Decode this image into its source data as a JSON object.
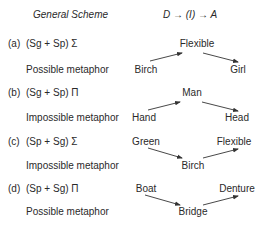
{
  "header": {
    "title": "General Scheme",
    "formula": "D → (I) → A"
  },
  "schemes": [
    {
      "letter": "(a)",
      "formula": "(Sg + Sp) Σ",
      "verdict": "Possible metaphor",
      "shape": "peak",
      "nodes": {
        "left": "Birch",
        "middle": "Flexible",
        "right": "Girl"
      }
    },
    {
      "letter": "(b)",
      "formula": "(Sg + Sp) Π",
      "verdict": "Impossible metaphor",
      "shape": "peak",
      "nodes": {
        "left": "Hand",
        "middle": "Man",
        "right": "Head"
      }
    },
    {
      "letter": "(c)",
      "formula": "(Sp + Sg) Σ",
      "verdict": "Impossible metaphor",
      "shape": "valley",
      "nodes": {
        "left": "Green",
        "middle": "Birch",
        "right": "Flexible"
      }
    },
    {
      "letter": "(d)",
      "formula": "(Sp + Sg) Π",
      "verdict": "Possible metaphor",
      "shape": "valley",
      "nodes": {
        "left": "Boat",
        "middle": "Bridge",
        "right": "Denture"
      }
    }
  ],
  "colors": {
    "text": "#2a2a2a",
    "arrow": "#333333",
    "background": "#ffffff"
  }
}
